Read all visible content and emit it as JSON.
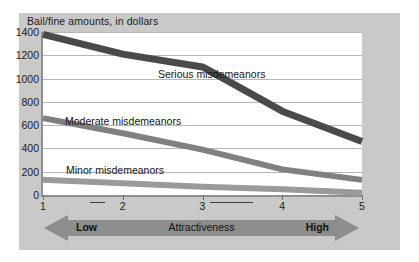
{
  "chart_data": {
    "type": "line",
    "title": "Bail/fine amounts, in dollars",
    "xlabel": "Attractiveness",
    "ylabel": "",
    "x": [
      1,
      2,
      3,
      4,
      5
    ],
    "categories": [
      "1",
      "2",
      "3",
      "4",
      "5"
    ],
    "xlim": [
      1,
      5
    ],
    "ylim": [
      0,
      1400
    ],
    "yticks": [
      0,
      200,
      400,
      600,
      800,
      1000,
      1200,
      1400
    ],
    "ytick_labels": [
      "0",
      "200",
      "400",
      "600",
      "800",
      "1000",
      "1200",
      "1400"
    ],
    "xtick_labels": [
      "1",
      "2",
      "3",
      "4",
      "5"
    ],
    "grid": "horizontal",
    "legend": "inline-labels",
    "series": [
      {
        "name": "Serious misdemeanors",
        "values": [
          1380,
          1210,
          1100,
          720,
          460
        ],
        "color": "#4a4a4a",
        "width": 7
      },
      {
        "name": "Moderate misdemeanors",
        "values": [
          660,
          530,
          390,
          220,
          130
        ],
        "color": "#808080",
        "width": 6
      },
      {
        "name": "Minor misdemeanors",
        "values": [
          130,
          100,
          70,
          50,
          20
        ],
        "color": "#9a9a9a",
        "width": 6
      }
    ],
    "annotations": {
      "axis_low": "Low",
      "axis_high": "High",
      "axis_center": "Attractiveness"
    },
    "colors": {
      "panel_background": "#c9c9c9",
      "plot_background": "#ffffff",
      "gridline": "#b6b6b6",
      "axis": "#8f8f8f",
      "arrow": "#8d8d8d",
      "text": "#1b1b1b"
    }
  }
}
